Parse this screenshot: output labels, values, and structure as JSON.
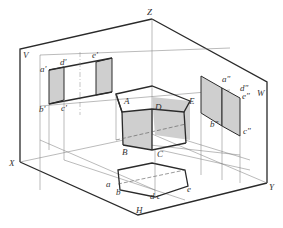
{
  "figure": {
    "planes": {
      "V": "V",
      "W": "W",
      "H": "H"
    },
    "axes": {
      "X": "X",
      "Y": "Y",
      "Z": "Z"
    },
    "solid_vertices": {
      "A": "A",
      "B": "B",
      "C": "C",
      "D": "D",
      "E": "E"
    },
    "v_projection_labels": {
      "a": "a'",
      "b": "b'",
      "c": "c'",
      "d": "d'",
      "e": "e'"
    },
    "w_projection_labels": {
      "a": "a\"",
      "b": "b\"",
      "c": "c\"",
      "d": "d\"",
      "e": "e\""
    },
    "h_projection_labels": {
      "a": "a",
      "b": "b",
      "dc": "d c",
      "e": "e"
    },
    "colors": {
      "line": "#2a2a2a",
      "shade": "#cfcfcf",
      "thin": "#777777"
    }
  }
}
